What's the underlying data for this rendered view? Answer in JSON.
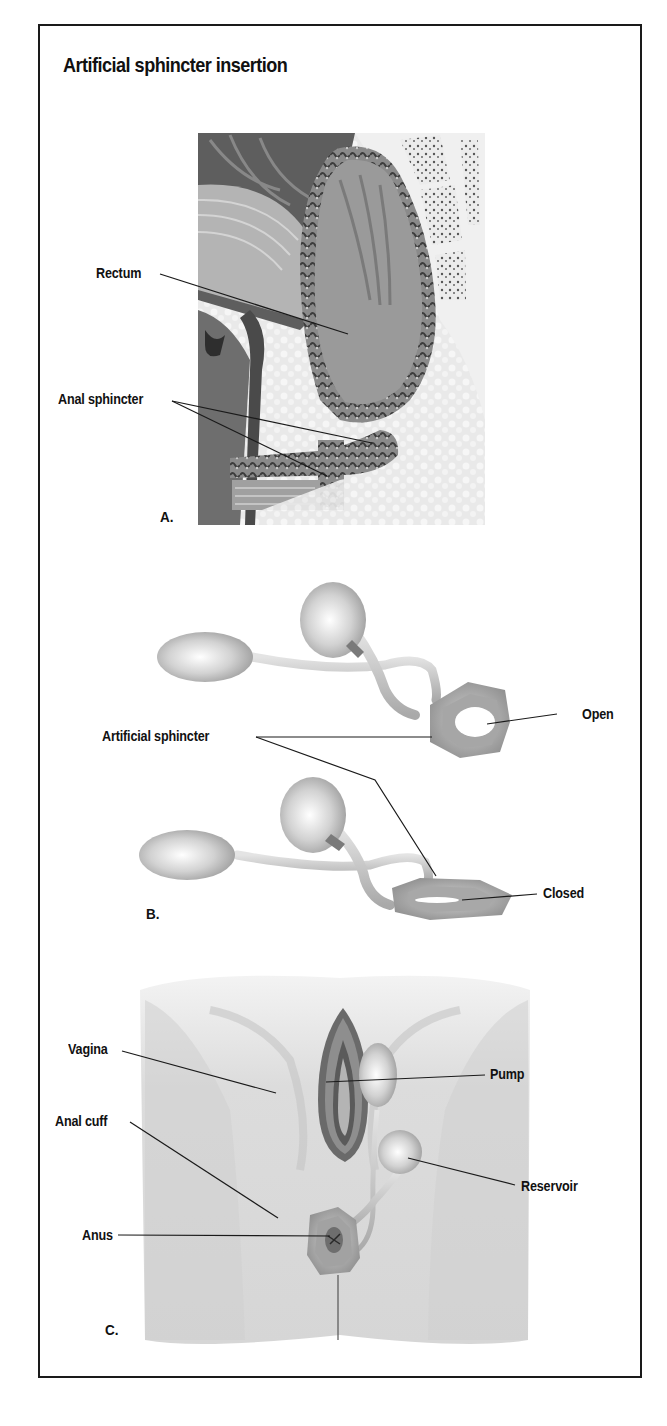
{
  "figure": {
    "title": "Artificial sphincter insertion",
    "panels": [
      {
        "id": "A",
        "letter": "A.",
        "description": "Sagittal cross-section of pelvis showing rectum and anal sphincter",
        "labels": [
          {
            "text": "Rectum"
          },
          {
            "text": "Anal sphincter"
          }
        ]
      },
      {
        "id": "B",
        "letter": "B.",
        "description": "Artificial sphincter device shown open and closed",
        "labels": [
          {
            "text": "Artificial sphincter"
          },
          {
            "text": "Open"
          },
          {
            "text": "Closed"
          }
        ]
      },
      {
        "id": "C",
        "letter": "C.",
        "description": "Perineal view of implanted artificial sphincter",
        "labels": [
          {
            "text": "Vagina"
          },
          {
            "text": "Pump"
          },
          {
            "text": "Anal cuff"
          },
          {
            "text": "Reservoir"
          },
          {
            "text": "Anus"
          }
        ]
      }
    ]
  },
  "colors": {
    "border": "#1a1a1a",
    "text": "#111111",
    "device_gray": "#b8b8b8",
    "tissue_dark": "#5a5a5a",
    "tissue_light": "#d8d8d8"
  }
}
